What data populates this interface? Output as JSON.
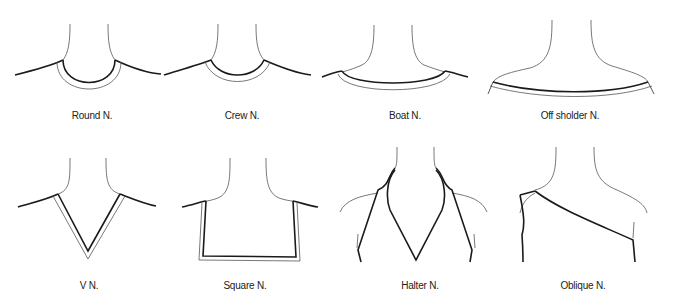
{
  "figure": {
    "panels": [
      {
        "id": "round",
        "label": "Round N."
      },
      {
        "id": "crew",
        "label": "Crew N."
      },
      {
        "id": "boat",
        "label": "Boat N."
      },
      {
        "id": "off-shoulder",
        "label": "Off sholder N."
      },
      {
        "id": "v",
        "label": "V N."
      },
      {
        "id": "square",
        "label": "Square N."
      },
      {
        "id": "halter",
        "label": "Halter N."
      },
      {
        "id": "oblique",
        "label": "Oblique N."
      }
    ]
  }
}
